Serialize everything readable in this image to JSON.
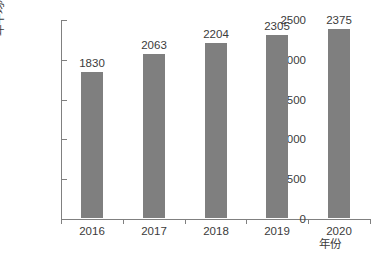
{
  "chart_data": {
    "type": "bar",
    "title": "",
    "subtitle": "",
    "categories": [
      "2016",
      "2017",
      "2018",
      "2019",
      "2020"
    ],
    "values": [
      1830,
      2063,
      2204,
      2305,
      2375
    ],
    "data_labels": [
      "1830",
      "2063",
      "2204",
      "2305",
      "2375"
    ],
    "series": [
      {
        "name": "",
        "values": [
          1830,
          2063,
          2204,
          2305,
          2375
        ]
      }
    ],
    "xlabel": "年份",
    "ylabel": "年平均利用小时数/h",
    "ylim": [
      0,
      2500
    ],
    "ytick_values": [
      0,
      500,
      1000,
      1500,
      2000,
      2500
    ],
    "ytick_labels": [
      "0",
      "500",
      "1000",
      "1500",
      "2000",
      "2500"
    ],
    "grid": false,
    "legend": null,
    "legend_position": "none",
    "bar_color": "#7f7f7f",
    "axis_color": "#808080",
    "text_color": "#3b3b3b",
    "background_color": "#ffffff"
  }
}
